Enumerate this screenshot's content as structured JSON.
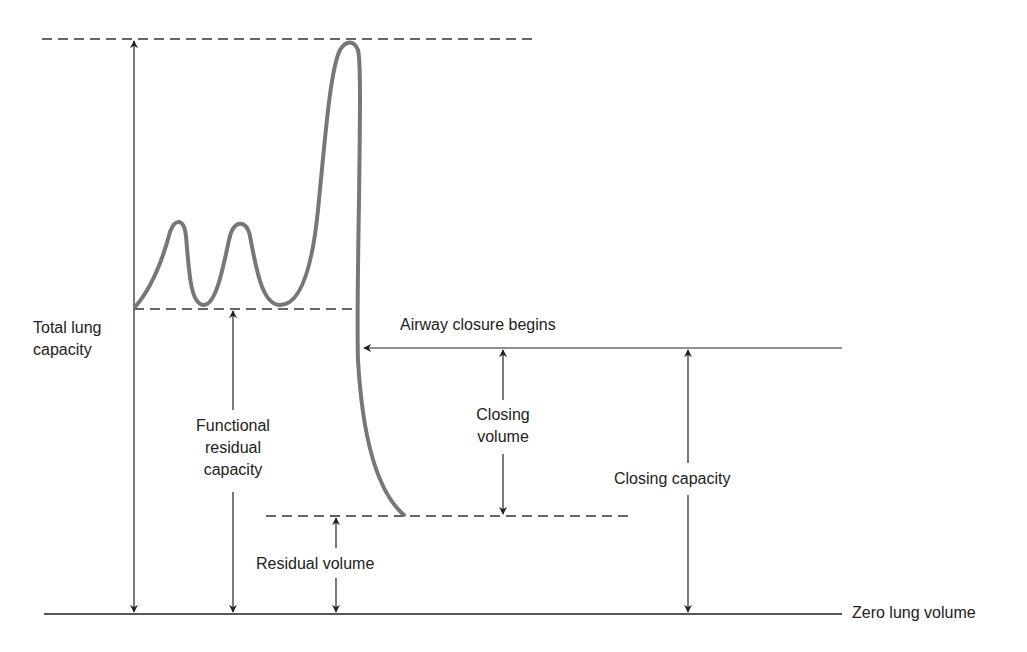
{
  "diagram": {
    "colors": {
      "background": "#ffffff",
      "line": "#222222",
      "curve": "#777777"
    },
    "labels": {
      "total_lung_capacity": [
        "Total lung",
        "capacity"
      ],
      "functional_residual_capacity": [
        "Functional",
        "residual",
        "capacity"
      ],
      "airway_closure": "Airway closure begins",
      "closing_volume": [
        "Closing",
        "volume"
      ],
      "closing_capacity": "Closing capacity",
      "residual_volume": "Residual volume",
      "zero_lung_volume": "Zero lung volume"
    },
    "levels": {
      "total_lung_capacity_y": 39,
      "functional_residual_capacity_y": 309,
      "airway_closure_y": 348,
      "residual_volume_y": 516,
      "zero_lung_volume_y": 614
    },
    "spirometry_trace": {
      "description": "Two tidal breaths, then maximal inspiration to TLC, then slow full expiration to residual volume",
      "tidal_peaks": 2,
      "max_inspiration_peak_x": 347
    }
  }
}
